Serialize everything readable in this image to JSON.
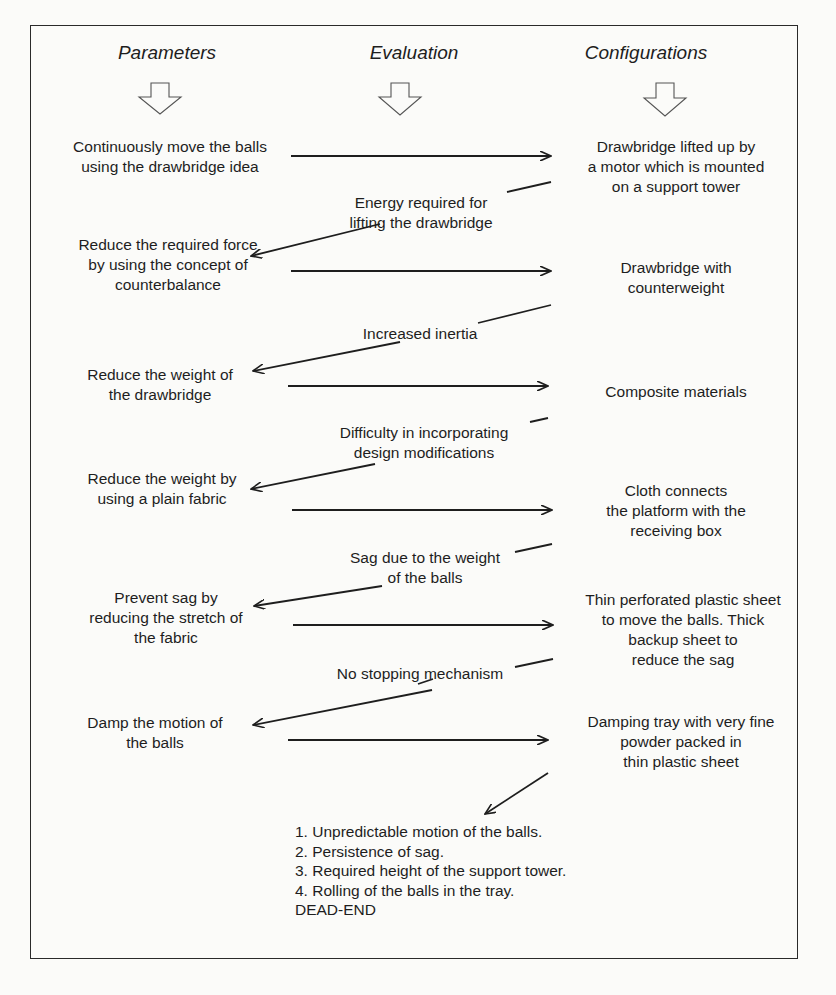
{
  "diagram": {
    "columns": {
      "parameters": "Parameters",
      "evaluation": "Evaluation",
      "configurations": "Configurations"
    },
    "steps": [
      {
        "parameter": [
          "Continuously move the balls",
          "using the drawbridge idea"
        ],
        "configuration": [
          "Drawbridge lifted up by",
          "a motor which is mounted",
          "on a support tower"
        ],
        "evaluation": [
          "Energy required for",
          "lifting the drawbridge"
        ]
      },
      {
        "parameter": [
          "Reduce the required force",
          "by using the concept of",
          "counterbalance"
        ],
        "configuration": [
          "Drawbridge with",
          "counterweight"
        ],
        "evaluation": [
          "Increased inertia"
        ]
      },
      {
        "parameter": [
          "Reduce the weight of",
          "the drawbridge"
        ],
        "configuration": [
          "Composite materials"
        ],
        "evaluation": [
          "Difficulty in incorporating",
          "design modifications"
        ]
      },
      {
        "parameter": [
          "Reduce the weight by",
          "using a plain fabric"
        ],
        "configuration": [
          "Cloth connects",
          "the platform with the",
          "receiving box"
        ],
        "evaluation": [
          "Sag due to the weight",
          "of the balls"
        ]
      },
      {
        "parameter": [
          "Prevent sag by",
          "reducing the stretch of",
          "the fabric"
        ],
        "configuration": [
          "Thin perforated plastic sheet",
          "to move the balls. Thick",
          "backup sheet to",
          "reduce the sag"
        ],
        "evaluation": [
          "No stopping mechanism"
        ]
      },
      {
        "parameter": [
          "Damp the motion of",
          "the balls"
        ],
        "configuration": [
          "Damping tray with very fine",
          "powder packed in",
          "thin plastic sheet"
        ],
        "evaluation": []
      }
    ],
    "final_evaluation": {
      "items": [
        "1. Unpredictable motion of the balls.",
        "2. Persistence of sag.",
        "3. Required height of the support tower.",
        "4. Rolling of the balls in the tray."
      ],
      "conclusion": "DEAD-END"
    },
    "colors": {
      "ink": "#1e1e1e",
      "paper": "#fbfbf9"
    }
  }
}
